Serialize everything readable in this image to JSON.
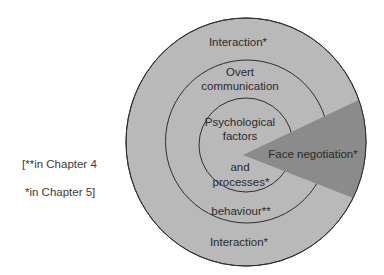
{
  "diagram": {
    "colors": {
      "circle_fill": "#b9b9b9",
      "wedge_fill": "#8b8b8b",
      "stroke": "#2e2e2e",
      "text": "#2a2a2a"
    },
    "rings": {
      "outer": {
        "label_top": "Interaction*",
        "label_bottom": "Interaction*"
      },
      "middle": {
        "label_top_line1": "Overt",
        "label_top_line2": "communication",
        "label_bottom": "behaviour**"
      },
      "inner": {
        "label_line1": "Psychological",
        "label_line2": "factors",
        "label_line3": "and",
        "label_line4": "processes*"
      }
    },
    "wedge": {
      "label": "Face negotiation*"
    },
    "legend": {
      "line1": "[**in Chapter 4",
      "line2": "*in Chapter 5]"
    }
  }
}
